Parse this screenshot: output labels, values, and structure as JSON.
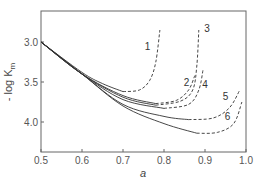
{
  "chart_data": {
    "type": "line",
    "title": "",
    "xlabel": "a",
    "ylabel": "- log K_m",
    "xlim": [
      0.5,
      1.0
    ],
    "ylim": [
      4.35,
      2.6
    ],
    "y_inverted": true,
    "grid": false,
    "legend": "inline numeric labels 1-6",
    "x_ticks": [
      0.5,
      0.6,
      0.7,
      0.8,
      0.9,
      1.0
    ],
    "x_tick_labels": [
      "0.5",
      "0.6",
      "0.7",
      "0.8",
      "0.9",
      "1.0"
    ],
    "y_ticks": [
      3.0,
      3.5,
      4.0
    ],
    "y_tick_labels": [
      "3.0",
      "3.5",
      "4.0"
    ],
    "series": [
      {
        "name": "1",
        "solid": [
          [
            0.5,
            3.0
          ],
          [
            0.6,
            3.38
          ],
          [
            0.65,
            3.52
          ],
          [
            0.7,
            3.62
          ]
        ],
        "dashed": [
          [
            0.7,
            3.62
          ],
          [
            0.74,
            3.6
          ],
          [
            0.765,
            3.48
          ],
          [
            0.78,
            3.25
          ],
          [
            0.79,
            2.85
          ]
        ],
        "label_pos": [
          0.76,
          3.1
        ]
      },
      {
        "name": "2",
        "solid": [
          [
            0.5,
            3.0
          ],
          [
            0.6,
            3.4
          ],
          [
            0.7,
            3.67
          ],
          [
            0.78,
            3.77
          ]
        ],
        "dashed": [
          [
            0.78,
            3.77
          ],
          [
            0.83,
            3.73
          ],
          [
            0.86,
            3.6
          ],
          [
            0.875,
            3.42
          ]
        ],
        "label_pos": [
          0.855,
          3.55
        ]
      },
      {
        "name": "3",
        "solid": [
          [
            0.5,
            3.0
          ],
          [
            0.6,
            3.4
          ],
          [
            0.7,
            3.69
          ],
          [
            0.78,
            3.79
          ]
        ],
        "dashed": [
          [
            0.78,
            3.79
          ],
          [
            0.84,
            3.74
          ],
          [
            0.87,
            3.6
          ],
          [
            0.88,
            3.3
          ],
          [
            0.885,
            2.85
          ]
        ],
        "label_pos": [
          0.905,
          2.88
        ]
      },
      {
        "name": "4",
        "solid": [
          [
            0.5,
            3.0
          ],
          [
            0.6,
            3.4
          ],
          [
            0.7,
            3.72
          ],
          [
            0.8,
            3.83
          ]
        ],
        "dashed": [
          [
            0.8,
            3.83
          ],
          [
            0.86,
            3.78
          ],
          [
            0.885,
            3.6
          ],
          [
            0.895,
            3.35
          ]
        ],
        "label_pos": [
          0.9,
          3.57
        ]
      },
      {
        "name": "5",
        "solid": [
          [
            0.5,
            3.0
          ],
          [
            0.6,
            3.4
          ],
          [
            0.7,
            3.78
          ],
          [
            0.8,
            3.93
          ],
          [
            0.86,
            3.97
          ]
        ],
        "dashed": [
          [
            0.86,
            3.97
          ],
          [
            0.92,
            3.95
          ],
          [
            0.96,
            3.82
          ],
          [
            0.985,
            3.6
          ]
        ],
        "label_pos": [
          0.95,
          3.72
        ]
      },
      {
        "name": "6",
        "solid": [
          [
            0.5,
            3.0
          ],
          [
            0.6,
            3.4
          ],
          [
            0.7,
            3.8
          ],
          [
            0.8,
            4.02
          ],
          [
            0.88,
            4.14
          ]
        ],
        "dashed": [
          [
            0.88,
            4.14
          ],
          [
            0.93,
            4.13
          ],
          [
            0.97,
            4.02
          ],
          [
            0.99,
            3.75
          ]
        ],
        "label_pos": [
          0.955,
          3.97
        ]
      }
    ]
  },
  "axes": {
    "y_label_main": "- log K",
    "y_label_sub": "m",
    "x_label": "a"
  }
}
